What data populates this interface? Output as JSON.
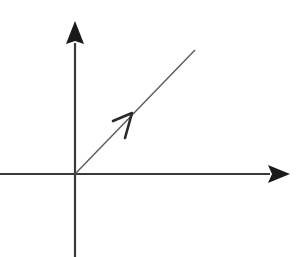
{
  "diagram": {
    "type": "vector-on-axes",
    "colors": {
      "background": "#ffffff",
      "axis": "#3a3a3a",
      "arrowhead": "#1a1a1a",
      "vector": "#5a5a5a",
      "vector_head": "#2a2a2a"
    },
    "origin": {
      "x": 75,
      "y": 174
    },
    "axes": {
      "x_axis": {
        "from": [
          0,
          174
        ],
        "to": [
          270,
          174
        ],
        "arrow_tip": [
          290,
          174
        ],
        "direction": "right"
      },
      "y_axis": {
        "from": [
          75,
          257
        ],
        "to": [
          75,
          43
        ],
        "arrow_tip": [
          75,
          21
        ],
        "direction": "up"
      }
    },
    "vector": {
      "from": [
        75,
        174
      ],
      "to": [
        195,
        50
      ],
      "mid_arrow": {
        "tip": [
          132,
          113
        ],
        "arm1": [
          113,
          121
        ],
        "arm2": [
          125,
          138
        ],
        "style": "open-chevron"
      }
    },
    "labels": []
  }
}
